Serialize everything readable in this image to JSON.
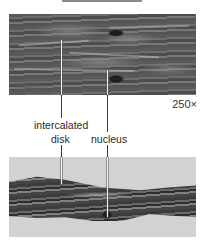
{
  "figure": {
    "type": "micrograph-comparison",
    "magnification": "250×",
    "labels": {
      "intercalated_disk": [
        "intercalated",
        "disk"
      ],
      "nucleus": "nucleus"
    },
    "panels": [
      {
        "name": "top-micrograph",
        "subject": "cardiac muscle tissue (darker stain)"
      },
      {
        "name": "bottom-micrograph",
        "subject": "cardiac muscle fiber (light background)"
      }
    ],
    "colors": {
      "background": "#ffffff",
      "tissue_dark": "#3c3c3c",
      "tissue_mid": "#6a6a6a",
      "bottom_background": "#d2d2d2",
      "text": "#2a2a2a"
    }
  }
}
